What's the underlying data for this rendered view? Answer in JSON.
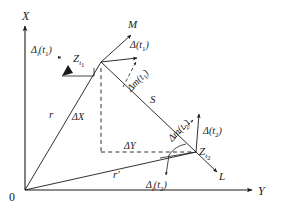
{
  "figure": {
    "background_color": "#ffffff",
    "stroke_color": "#1a1a1a",
    "width": 282,
    "height": 215
  },
  "axes": {
    "vertical": {
      "name": "x-axis",
      "label": "X",
      "direction": "up"
    },
    "horizontal": {
      "name": "y-axis",
      "label": "Y",
      "direction": "right"
    },
    "origin": {
      "name": "origin",
      "label": "0"
    }
  },
  "points": [
    {
      "id": "z_t1",
      "base": "Z",
      "sub": "t",
      "sub2": "1",
      "label": "Z t1"
    },
    {
      "id": "z_t2",
      "base": "Z",
      "sub": "t",
      "sub2": "2",
      "label": "Z t2"
    }
  ],
  "vectors": [
    {
      "id": "r",
      "label": "r",
      "desc": "position vector to Z t1"
    },
    {
      "id": "r_prime",
      "label": "r′",
      "desc": "position vector to Z t2"
    },
    {
      "id": "s",
      "label": "S",
      "desc": "baseline between Z t1 and Z t2"
    }
  ],
  "direction_labels": [
    {
      "id": "m_dir",
      "label": "M",
      "desc": "meridian direction arrow at Z t1"
    },
    {
      "id": "l_dir",
      "label": "L",
      "desc": "direction arrow at Z t2"
    }
  ],
  "deltas": {
    "delta_i_t1": {
      "base": "Δ",
      "sub": "i",
      "arg_open": "(",
      "arg_base": "t",
      "arg_sub": "1",
      "arg_close": ")"
    },
    "delta_t1": {
      "base": "Δ",
      "sub": "",
      "arg_open": "(",
      "arg_base": "t",
      "arg_sub": "1",
      "arg_close": ")"
    },
    "delta_m_t1": {
      "base": "Δm",
      "sub": "",
      "arg_open": "(",
      "arg_base": "t",
      "arg_sub": "1",
      "arg_close": ")"
    },
    "delta_m_t2": {
      "base": "Δm",
      "sub": "",
      "arg_open": "(",
      "arg_base": "t",
      "arg_sub": "2",
      "arg_close": ")"
    },
    "delta_t2": {
      "base": "Δ",
      "sub": "",
      "arg_open": "(",
      "arg_base": "t",
      "arg_sub": "2",
      "arg_close": ")"
    },
    "delta_i_t2": {
      "base": "Δ",
      "sub": "i",
      "arg_open": "(",
      "arg_base": "t",
      "arg_sub": "2",
      "arg_close": ")"
    }
  },
  "components": {
    "delta_x": {
      "base": "Δ",
      "var": "X",
      "label": "ΔX"
    },
    "delta_y": {
      "base": "Δ",
      "var": "Y",
      "label": "ΔY"
    }
  }
}
